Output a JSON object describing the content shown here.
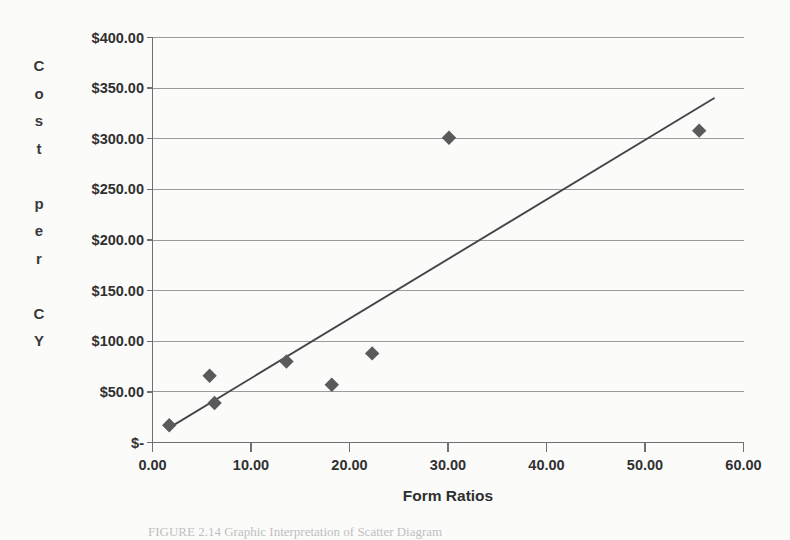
{
  "chart_data": {
    "type": "scatter",
    "title": "",
    "xlabel": "Form Ratios",
    "ylabel": "Cost per CY",
    "ylabel_chars": [
      "C",
      "o",
      "s",
      "t",
      "",
      "p",
      "e",
      "r",
      "",
      "C",
      "Y"
    ],
    "xlim": [
      0,
      60
    ],
    "ylim": [
      0,
      400
    ],
    "grid": true,
    "legend": false,
    "xticks": [
      0,
      10,
      20,
      30,
      40,
      50,
      60
    ],
    "xtick_labels": [
      "0.00",
      "10.00",
      "20.00",
      "30.00",
      "40.00",
      "50.00",
      "60.00"
    ],
    "yticks": [
      0,
      50,
      100,
      150,
      200,
      250,
      300,
      350,
      400
    ],
    "ytick_labels": [
      "$-",
      "$50.00",
      "$100.00",
      "$150.00",
      "$200.00",
      "$250.00",
      "$300.00",
      "$350.00",
      "$400.00"
    ],
    "series": [
      {
        "name": "Cost per CY",
        "marker": "diamond",
        "color": "#595a5c",
        "points": [
          {
            "x": 1.7,
            "y": 17
          },
          {
            "x": 5.8,
            "y": 66
          },
          {
            "x": 6.3,
            "y": 39
          },
          {
            "x": 13.6,
            "y": 80
          },
          {
            "x": 18.2,
            "y": 57
          },
          {
            "x": 22.3,
            "y": 88
          },
          {
            "x": 30.1,
            "y": 301
          },
          {
            "x": 55.5,
            "y": 308
          }
        ]
      }
    ],
    "trendline": {
      "name": "Linear trendline",
      "color": "#44454a",
      "x0": 1.6,
      "y0": 14,
      "x1": 57.0,
      "y1": 340
    }
  },
  "caption": {
    "text": "FIGURE 2.14    Graphic Interpretation of Scatter Diagram"
  }
}
